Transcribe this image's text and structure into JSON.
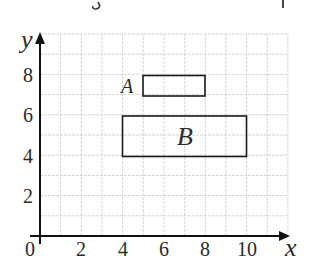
{
  "header": {
    "cropped_text_fragment": "g p"
  },
  "chart_data": {
    "type": "diagram",
    "title": "",
    "xlabel": "x",
    "ylabel": "y",
    "origin_label": "0",
    "xlim": [
      0,
      12
    ],
    "ylim": [
      0,
      10
    ],
    "grid": true,
    "grid_step": 1,
    "x_ticks": [
      2,
      4,
      6,
      8,
      10
    ],
    "y_ticks": [
      2,
      4,
      6,
      8
    ],
    "shapes": [
      {
        "label": "A",
        "type": "rectangle",
        "x_min": 5,
        "x_max": 8,
        "y_min": 7,
        "y_max": 8,
        "label_position": "left"
      },
      {
        "label": "B",
        "type": "rectangle",
        "x_min": 4,
        "x_max": 10,
        "y_min": 4,
        "y_max": 6,
        "label_position": "center"
      }
    ]
  },
  "labels": {
    "x_axis": "x",
    "y_axis": "y",
    "origin": "0",
    "x_tick_2": "2",
    "x_tick_4": "4",
    "x_tick_6": "6",
    "x_tick_8": "8",
    "x_tick_10": "10",
    "y_tick_2": "2",
    "y_tick_4": "4",
    "y_tick_6": "6",
    "y_tick_8": "8",
    "rect_a": "A",
    "rect_b": "B"
  },
  "colors": {
    "grid": "#d4d4d4",
    "axis": "#111111",
    "shape": "#1a1a1a",
    "text": "#2a2a2a"
  }
}
